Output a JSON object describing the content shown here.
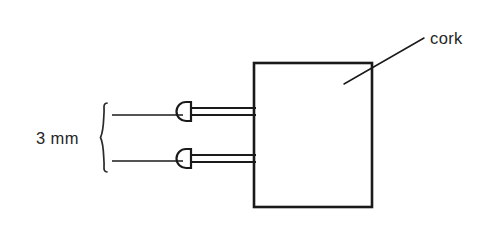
{
  "diagram": {
    "background_color": "#ffffff",
    "line_color": "#1a1a1a",
    "text_color": "#262626"
  },
  "labels": {
    "cork": "cork",
    "spacing": "3 mm"
  },
  "cork_block": {
    "name": "cork",
    "x": 254,
    "y": 63,
    "width": 118,
    "height": 144
  },
  "pins": [
    {
      "name": "upper-pin",
      "head_center_x": 188,
      "head_center_y": 111,
      "head_width": 12,
      "head_height": 19,
      "shaft_top_y": 108,
      "shaft_bottom_y": 115,
      "shaft_end_x": 256
    },
    {
      "name": "lower-pin",
      "head_center_x": 188,
      "head_center_y": 158,
      "head_width": 12,
      "head_height": 19,
      "shaft_top_y": 155,
      "shaft_bottom_y": 162,
      "shaft_end_x": 256
    }
  ],
  "extension_lines": [
    {
      "name": "upper-extension-line",
      "x1": 112,
      "y1": 115,
      "x2": 183,
      "y2": 115
    },
    {
      "name": "lower-extension-line",
      "x1": 112,
      "y1": 161,
      "x2": 183,
      "y2": 161
    }
  ],
  "brace": {
    "name": "dimension-brace",
    "x": 103,
    "top_y": 103,
    "bottom_y": 173,
    "mid_y": 138
  },
  "leader_line": {
    "name": "cork-leader-line",
    "x1": 344,
    "y1": 84,
    "x2": 424,
    "y2": 38
  },
  "text_positions": {
    "cork": {
      "x": 430,
      "y": 44
    },
    "spacing": {
      "x": 36,
      "y": 144
    }
  }
}
